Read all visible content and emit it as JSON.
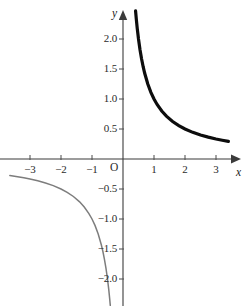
{
  "figure": {
    "kind": "cartesian-plot",
    "background_color": "#ffffff",
    "width": 248,
    "height": 306,
    "axis_color": "#3b3b3b",
    "tick_color": "#4a4a4a",
    "label_color": "#2b2b2b"
  },
  "axes": {
    "x_axis_label": "x",
    "y_axis_label": "y",
    "origin_label": "O",
    "x_ticks": [
      {
        "value": -3,
        "label": "−3",
        "px": 30
      },
      {
        "value": -2,
        "label": "−2",
        "px": 61
      },
      {
        "value": -1,
        "label": "−1",
        "px": 92
      },
      {
        "value": 1,
        "label": "1",
        "px": 154
      },
      {
        "value": 2,
        "label": "2",
        "px": 185
      },
      {
        "value": 3,
        "label": "3",
        "px": 216
      }
    ],
    "y_ticks": [
      {
        "value": 2.0,
        "label": "2.0",
        "px": 39
      },
      {
        "value": 1.5,
        "label": "1.5",
        "px": 69
      },
      {
        "value": 1.0,
        "label": "1.0",
        "px": 99
      },
      {
        "value": 0.5,
        "label": "0.5",
        "px": 129
      },
      {
        "value": -0.5,
        "label": "−0.5",
        "px": 189
      },
      {
        "value": -1.0,
        "label": "−1.0",
        "px": 219
      },
      {
        "value": -1.5,
        "label": "−1.5",
        "px": 249
      },
      {
        "value": -2.0,
        "label": "−2.0",
        "px": 279
      }
    ]
  },
  "chart_data": {
    "type": "line",
    "title": "",
    "xlabel": "x",
    "ylabel": "y",
    "xlim": [
      -3.9,
      3.7
    ],
    "ylim": [
      -2.45,
      2.45
    ],
    "grid": false,
    "legend": "none",
    "function": "y = 1/x",
    "xticks": [
      -3,
      -2,
      -1,
      1,
      2,
      3
    ],
    "xticklabels": [
      "−3",
      "−2",
      "−1",
      "1",
      "2",
      "3"
    ],
    "yticks": [
      -2.0,
      -1.5,
      -1.0,
      -0.5,
      0.5,
      1.0,
      1.5,
      2.0
    ],
    "yticklabels": [
      "−2.0",
      "−1.5",
      "−1.0",
      "−0.5",
      "0.5",
      "1.0",
      "1.5",
      "2.0"
    ],
    "series": [
      {
        "name": "y = 1/x (x > 0)",
        "color": "#0d0d0d",
        "linewidth": 3.2,
        "x": [
          0.405,
          0.43,
          0.46,
          0.5,
          0.55,
          0.6,
          0.65,
          0.7,
          0.8,
          0.9,
          1.0,
          1.1,
          1.25,
          1.4,
          1.6,
          1.8,
          2.0,
          2.25,
          2.5,
          2.75,
          3.0,
          3.2,
          3.4
        ],
        "y": [
          2.47,
          2.326,
          2.174,
          2.0,
          1.818,
          1.667,
          1.538,
          1.429,
          1.25,
          1.111,
          1.0,
          0.909,
          0.8,
          0.714,
          0.625,
          0.556,
          0.5,
          0.444,
          0.4,
          0.364,
          0.333,
          0.313,
          0.294
        ]
      },
      {
        "name": "y = 1/x (x < 0)",
        "color": "#7d7d7d",
        "linewidth": 1.5,
        "x": [
          -3.65,
          -3.4,
          -3.2,
          -3.0,
          -2.75,
          -2.5,
          -2.25,
          -2.0,
          -1.8,
          -1.6,
          -1.4,
          -1.25,
          -1.1,
          -1.0,
          -0.9,
          -0.8,
          -0.7,
          -0.65,
          -0.6,
          -0.55,
          -0.5,
          -0.46,
          -0.43,
          -0.41
        ],
        "y": [
          -0.274,
          -0.294,
          -0.313,
          -0.333,
          -0.364,
          -0.4,
          -0.444,
          -0.5,
          -0.556,
          -0.625,
          -0.714,
          -0.8,
          -0.909,
          -1.0,
          -1.111,
          -1.25,
          -1.429,
          -1.538,
          -1.667,
          -1.818,
          -2.0,
          -2.174,
          -2.326,
          -2.44
        ]
      }
    ]
  }
}
